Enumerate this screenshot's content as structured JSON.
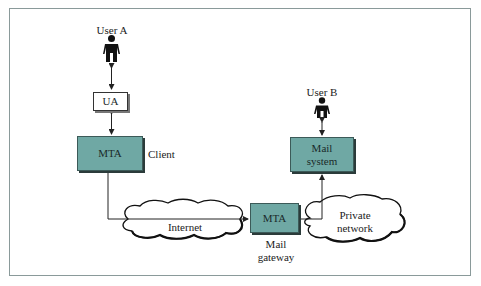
{
  "diagram": {
    "colors": {
      "box_fill": "#6fa8a4",
      "box_border": "#3c5a58",
      "frame_border": "#8a9a9a",
      "line": "#222222"
    },
    "nodes": {
      "user_a": {
        "label": "User A",
        "icon": "person-icon"
      },
      "ua": {
        "label": "UA"
      },
      "mta_client": {
        "label": "MTA",
        "side_label": "Client"
      },
      "internet": {
        "label": "Internet",
        "shape": "cloud"
      },
      "mta_gateway": {
        "label": "MTA",
        "caption_line1": "Mail",
        "caption_line2": "gateway"
      },
      "private_network": {
        "line1": "Private",
        "line2": "network",
        "shape": "cloud"
      },
      "mail_system": {
        "line1": "Mail",
        "line2": "system"
      },
      "user_b": {
        "label": "User B",
        "icon": "person-icon"
      }
    },
    "edges": [
      {
        "from": "user_a",
        "to": "ua",
        "type": "bidirectional"
      },
      {
        "from": "ua",
        "to": "mta_client",
        "type": "bidirectional"
      },
      {
        "from": "mta_client",
        "to": "mta_gateway",
        "via": "internet",
        "type": "directed"
      },
      {
        "from": "mta_gateway",
        "to": "mail_system",
        "via": "private_network",
        "type": "directed"
      },
      {
        "from": "mail_system",
        "to": "user_b",
        "type": "bidirectional"
      }
    ]
  }
}
